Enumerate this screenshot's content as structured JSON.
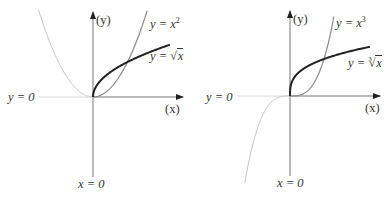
{
  "figure": {
    "width": 391,
    "height": 198,
    "colors": {
      "axis": "#777777",
      "axis_arrow": "#222222",
      "guide_line": "#d8d8d8",
      "power_curve_positive": "#8a8a8a",
      "power_curve_negative": "#c4c4c4",
      "root_curve": "#222222",
      "label": "#333333"
    }
  },
  "panels": [
    {
      "id": "square",
      "origin": {
        "x": 93,
        "y": 97
      },
      "unit": {
        "x": 34.5,
        "y": 35
      },
      "axes": {
        "y_axis": {
          "top": 12,
          "bottom": 177
        },
        "x_axis": {
          "left": 38,
          "right": 183
        },
        "y_label": "(y)",
        "x_label": "(x)",
        "horizontal_guide_label": "y = 0",
        "vertical_guide_label": "x = 0"
      },
      "curves": [
        {
          "name": "y = x^2",
          "kind": "power",
          "exponent": 2,
          "x_min": -1.58,
          "x_max": 1.57,
          "label": "y = x²",
          "label_main": "y = x",
          "label_sup": "2"
        },
        {
          "name": "y = sqrt(x)",
          "kind": "root",
          "index": 2,
          "x_min": 0,
          "x_max": 2.23,
          "label": "y = √x",
          "label_main": "y = ",
          "label_radicand": "x",
          "label_index": ""
        }
      ]
    },
    {
      "id": "cube",
      "origin": {
        "x": 290,
        "y": 96
      },
      "unit": {
        "x": 34,
        "y": 37
      },
      "axes": {
        "y_axis": {
          "top": 11,
          "bottom": 176
        },
        "x_axis": {
          "left": 237,
          "right": 380
        },
        "y_label": "(y)",
        "x_label": "(x)",
        "horizontal_guide_label": "y = 0",
        "vertical_guide_label": "x = 0"
      },
      "curves": [
        {
          "name": "y = x^3",
          "kind": "power",
          "exponent": 3,
          "x_min": -1.33,
          "x_max": 1.29,
          "label": "y = x³",
          "label_main": "y = x",
          "label_sup": "3"
        },
        {
          "name": "y = cbrt(x)",
          "kind": "root",
          "index": 3,
          "x_min": 0,
          "x_max": 2.35,
          "label": "y = ∛x",
          "label_main": "y = ",
          "label_radicand": "x",
          "label_index": "3"
        }
      ]
    }
  ],
  "labels": {
    "left": {
      "y_axis": "(y)",
      "x_axis": "(x)",
      "y_zero": "y = 0",
      "x_zero": "x = 0",
      "power_main": "y = x",
      "power_sup": "2",
      "root_main": "y = ",
      "root_sign": "√",
      "root_radicand": "x"
    },
    "right": {
      "y_axis": "(y)",
      "x_axis": "(x)",
      "y_zero": "y = 0",
      "x_zero": "x = 0",
      "power_main": "y = x",
      "power_sup": "3",
      "root_main": "y = ",
      "root_index": "3",
      "root_sign": "√",
      "root_radicand": "x"
    }
  }
}
